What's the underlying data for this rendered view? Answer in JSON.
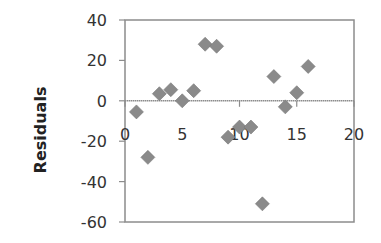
{
  "chart_data": {
    "type": "scatter",
    "title": "",
    "xlabel": "",
    "ylabel": "Residuals",
    "xlim": [
      0,
      20
    ],
    "ylim": [
      -60,
      40
    ],
    "x_ticks": [
      0,
      5,
      10,
      15,
      20
    ],
    "y_ticks": [
      40,
      20,
      0,
      -20,
      -40,
      -60
    ],
    "x_tick_labels": [
      "0",
      "5",
      "10",
      "15",
      "20"
    ],
    "y_tick_labels": [
      "40",
      "20",
      "0",
      "-20",
      "-40",
      "-60"
    ],
    "grid": false,
    "legend": null,
    "marker": "diamond",
    "marker_color": "#8a8a8a",
    "series": [
      {
        "name": "Residuals",
        "x": [
          1,
          2,
          3,
          4,
          5,
          6,
          7,
          8,
          9,
          10,
          11,
          12,
          13,
          14,
          15,
          16
        ],
        "y": [
          -5.5,
          -28,
          3.5,
          5.5,
          0,
          5,
          28,
          27,
          -18,
          -13,
          -13,
          -51,
          12,
          -3,
          4,
          17
        ]
      }
    ]
  }
}
